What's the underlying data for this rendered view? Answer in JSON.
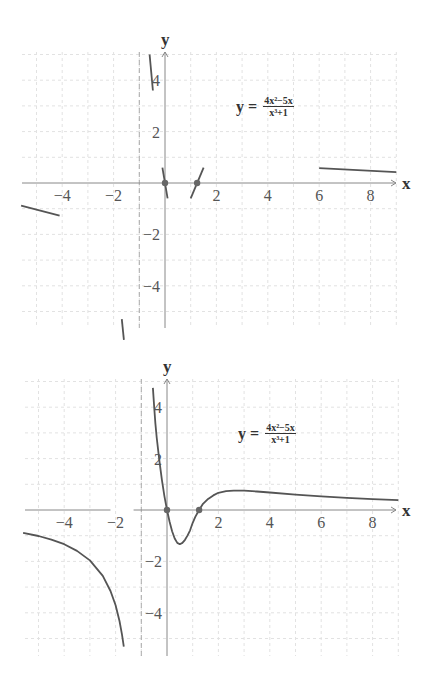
{
  "chart_data": [
    {
      "type": "line",
      "title": "Tangent-line segments of y = (4x^2-5x)/(x^3+1)",
      "equation": {
        "lhs": "y =",
        "numerator": "4x²−5x",
        "denominator": "x³+1"
      },
      "xlabel": "x",
      "ylabel": "y",
      "xlim": [
        -5.7,
        9
      ],
      "ylim": [
        -5.6,
        5.1
      ],
      "grid": true,
      "x_ticks": [
        -4,
        -2,
        2,
        4,
        6,
        8
      ],
      "y_ticks": [
        -4,
        -2,
        2,
        4
      ],
      "vertical_asymptote": -1,
      "horizontal_asymptote": 0,
      "points": [
        {
          "x": 0,
          "y": 0
        },
        {
          "x": 1.25,
          "y": 0
        }
      ],
      "series": [
        {
          "name": "segment-left",
          "x": [
            -5.6,
            -4.1
          ],
          "y": [
            -0.88,
            -1.27
          ]
        },
        {
          "name": "segment-near-asymptote-low",
          "x": [
            -1.68,
            -1.6
          ],
          "y": [
            -5.3,
            -6.1
          ]
        },
        {
          "name": "segment-near-asymptote-high",
          "x": [
            -0.6,
            -0.47
          ],
          "y": [
            5.0,
            3.6
          ]
        },
        {
          "name": "segment-origin",
          "x": [
            -0.1,
            0.1
          ],
          "y": [
            0.6,
            -0.6
          ]
        },
        {
          "name": "segment-root",
          "x": [
            1.0,
            1.5
          ],
          "y": [
            -0.6,
            0.6
          ]
        },
        {
          "name": "segment-right",
          "x": [
            6.0,
            9.0
          ],
          "y": [
            0.58,
            0.42
          ]
        }
      ]
    },
    {
      "type": "line",
      "title": "Graph of y = (4x^2-5x)/(x^3+1)",
      "equation": {
        "lhs": "y =",
        "numerator": "4x²−5x",
        "denominator": "x³+1"
      },
      "xlabel": "x",
      "ylabel": "y",
      "xlim": [
        -5.7,
        9
      ],
      "ylim": [
        -5.6,
        5.1
      ],
      "grid": true,
      "x_ticks": [
        -4,
        -2,
        2,
        4,
        6,
        8
      ],
      "y_ticks": [
        -4,
        -2,
        2,
        4
      ],
      "vertical_asymptote": -1,
      "horizontal_asymptote": 0,
      "points": [
        {
          "x": 0,
          "y": 0
        },
        {
          "x": 1.25,
          "y": 0
        }
      ],
      "series": [
        {
          "name": "left-branch",
          "x": [
            -5.6,
            -5,
            -4.5,
            -4,
            -3.5,
            -3,
            -2.5,
            -2.2,
            -2,
            -1.85,
            -1.75,
            -1.68
          ],
          "y": [
            -0.89,
            -1.01,
            -1.15,
            -1.33,
            -1.59,
            -1.96,
            -2.56,
            -3.15,
            -3.71,
            -4.32,
            -4.85,
            -5.32
          ]
        },
        {
          "name": "right-branch",
          "x": [
            -0.55,
            -0.5,
            -0.45,
            -0.4,
            -0.3,
            -0.2,
            -0.1,
            0,
            0.1,
            0.2,
            0.3,
            0.4,
            0.5,
            0.6,
            0.7,
            0.8,
            0.9,
            1.0,
            1.1,
            1.25,
            1.4,
            1.6,
            1.8,
            2.0,
            2.3,
            2.6,
            3.0,
            3.5,
            4,
            5,
            6,
            7,
            8,
            9
          ],
          "y": [
            4.75,
            4.0,
            3.36,
            2.82,
            1.94,
            1.17,
            0.54,
            0,
            -0.46,
            -0.83,
            -1.11,
            -1.28,
            -1.33,
            -1.28,
            -1.16,
            -0.99,
            -0.79,
            -0.5,
            -0.27,
            0,
            0.24,
            0.43,
            0.57,
            0.67,
            0.73,
            0.75,
            0.75,
            0.72,
            0.68,
            0.6,
            0.53,
            0.47,
            0.42,
            0.38
          ]
        }
      ]
    }
  ],
  "labels": {
    "x_axis": "x",
    "y_axis": "y",
    "x_ticks": [
      "−4",
      "−2",
      "2",
      "4",
      "6",
      "8"
    ],
    "y_ticks": [
      "4",
      "2",
      "−2",
      "−4"
    ],
    "equation_lhs": "y =",
    "equation_num": "4x²−5x",
    "equation_den": "x³+1"
  },
  "colors": {
    "curve": "#555555",
    "axis": "#888888",
    "grid": "#e2e2e2",
    "asymptote": "#aaaaaa",
    "point": "#666666"
  }
}
